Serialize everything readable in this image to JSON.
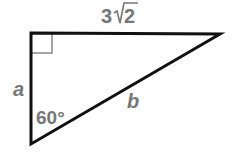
{
  "figure": {
    "type": "right-triangle",
    "colors": {
      "stroke": "#111111",
      "right_angle_marker": "#888888",
      "label": "#777777",
      "background": "#ffffff"
    },
    "vertices": {
      "top_left": [
        31,
        32
      ],
      "top_right": [
        220,
        34
      ],
      "bottom": [
        31,
        144
      ]
    },
    "labels": {
      "top_side_coefficient": "3",
      "top_side_radicand": "2",
      "top_side_full": "3√2",
      "left_side": "a",
      "hypotenuse": "b",
      "angle": "60°"
    },
    "right_angle_at": "top_left"
  }
}
